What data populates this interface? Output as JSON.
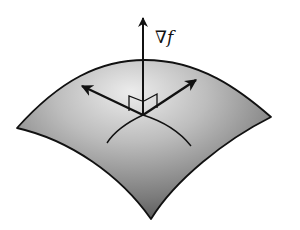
{
  "diagram": {
    "gradient_label": {
      "nabla": "∇",
      "f": "f"
    },
    "colors": {
      "surface_light": "#e6e6e6",
      "surface_dark": "#4a4a4a",
      "stroke": "#111111",
      "background": "#ffffff"
    },
    "elements": [
      {
        "name": "level-surface",
        "type": "curved-patch"
      },
      {
        "name": "gradient-vector",
        "type": "arrow",
        "direction": "up"
      },
      {
        "name": "tangent-vector-left",
        "type": "arrow"
      },
      {
        "name": "tangent-vector-right",
        "type": "arrow"
      },
      {
        "name": "surface-curve-left",
        "type": "curve"
      },
      {
        "name": "surface-curve-right",
        "type": "curve"
      },
      {
        "name": "right-angle-marker-left",
        "type": "marker"
      },
      {
        "name": "right-angle-marker-right",
        "type": "marker"
      }
    ]
  }
}
